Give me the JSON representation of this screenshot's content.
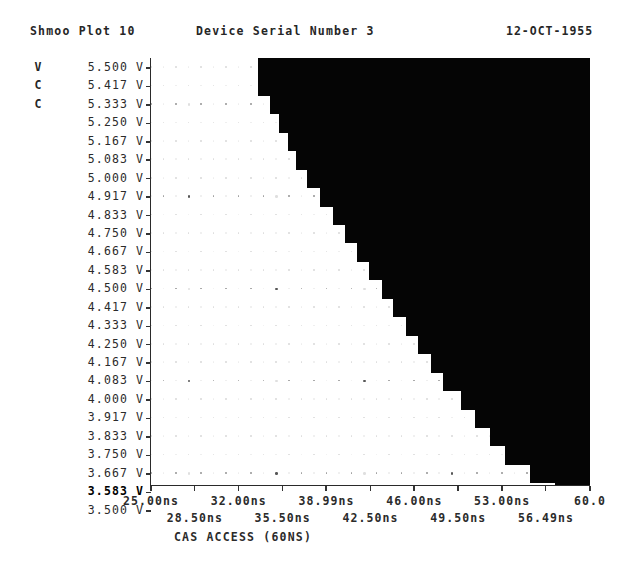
{
  "header": {
    "title": "Shmoo Plot 10",
    "device": "Device Serial Number 3",
    "date": "12-OCT-1955"
  },
  "flags": [
    "V",
    "C",
    "C"
  ],
  "row_marker": "@",
  "row_marker_index": 6,
  "axis_caption": "CAS ACCESS (60NS)",
  "chart_data": {
    "type": "heatmap",
    "title": "Shmoo Plot 10",
    "subtitle": "Device Serial Number 3",
    "xlabel": "CAS ACCESS (60NS)",
    "ylabel": "",
    "xlim": [
      25.0,
      60.0
    ],
    "ylim": [
      3.5,
      5.5
    ],
    "grid": true,
    "legend": "none",
    "x_unit": "ns",
    "y_unit": "V",
    "pass_color": "#ffffff",
    "fail_color": "#050505",
    "y_categories": [
      "5.500 V",
      "5.417 V",
      "5.333 V",
      "5.250 V",
      "5.167 V",
      "5.083 V",
      "5.000 V",
      "4.917 V",
      "4.833 V",
      "4.750 V",
      "4.667 V",
      "4.583 V",
      "4.500 V",
      "4.417 V",
      "4.333 V",
      "4.250 V",
      "4.167 V",
      "4.083 V",
      "4.000 V",
      "3.917 V",
      "3.833 V",
      "3.750 V",
      "3.667 V",
      "3.583 V",
      "3.500 V"
    ],
    "y_values": [
      5.5,
      5.417,
      5.333,
      5.25,
      5.167,
      5.083,
      5.0,
      4.917,
      4.833,
      4.75,
      4.667,
      4.583,
      4.5,
      4.417,
      4.333,
      4.25,
      4.167,
      4.083,
      4.0,
      3.917,
      3.833,
      3.75,
      3.667,
      3.583,
      3.5
    ],
    "y_bold_rows": [
      23
    ],
    "x_ticks_upper": [
      "25.00ns",
      "32.00ns",
      "38.99ns",
      "46.00ns",
      "53.00ns",
      "60.0"
    ],
    "x_ticks_upper_values": [
      25.0,
      32.0,
      38.99,
      46.0,
      53.0,
      60.0
    ],
    "x_ticks_lower": [
      "28.50ns",
      "35.50ns",
      "42.50ns",
      "49.50ns",
      "56.49ns"
    ],
    "x_ticks_lower_values": [
      28.5,
      35.5,
      42.5,
      49.5,
      56.49
    ],
    "series": [
      {
        "name": "fail region (left edge of failure, ns)",
        "values": [
          33.5,
          33.5,
          34.5,
          35.2,
          35.9,
          36.6,
          37.4,
          38.5,
          39.5,
          40.5,
          41.4,
          42.4,
          43.4,
          44.3,
          45.3,
          46.3,
          47.3,
          48.3,
          49.7,
          50.8,
          52.0,
          53.2,
          55.2,
          57.2,
          40.0
        ]
      }
    ]
  }
}
